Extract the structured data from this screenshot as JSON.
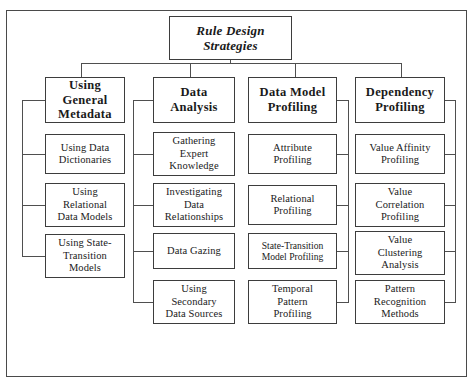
{
  "diagram": {
    "title": "Rule Design Strategies",
    "root": {
      "label": "Rule Design\nStrategies"
    },
    "branches": [
      {
        "id": "using-general-metadata",
        "header": "Using\nGeneral\nMetadata",
        "trunk_side": "left",
        "children": [
          {
            "label": "Using Data\nDictionaries"
          },
          {
            "label": "Using\nRelational\nData Models"
          },
          {
            "label": "Using State-\nTransition\nModels"
          }
        ]
      },
      {
        "id": "data-analysis",
        "header": "Data\nAnalysis",
        "trunk_side": "left",
        "children": [
          {
            "label": "Gathering\nExpert\nKnowledge"
          },
          {
            "label": "Investigating\nData\nRelationships"
          },
          {
            "label": "Data Gazing"
          },
          {
            "label": "Using\nSecondary\nData Sources"
          }
        ]
      },
      {
        "id": "data-model-profiling",
        "header": "Data Model\nProfiling",
        "trunk_side": "right",
        "children": [
          {
            "label": "Attribute\nProfiling"
          },
          {
            "label": "Relational\nProfiling"
          },
          {
            "label": "State-Transition\nModel Profiling"
          },
          {
            "label": "Temporal\nPattern\nProfiling"
          }
        ]
      },
      {
        "id": "dependency-profiling",
        "header": "Dependency\nProfiling",
        "trunk_side": "right",
        "children": [
          {
            "label": "Value Affinity\nProfiling"
          },
          {
            "label": "Value\nCorrelation\nProfiling"
          },
          {
            "label": "Value\nClustering\nAnalysis"
          },
          {
            "label": "Pattern\nRecognition\nMethods"
          }
        ]
      }
    ],
    "colors": {
      "background": "#ffffff",
      "box_border": "#3d3d3d",
      "connector": "#4f4f4f",
      "frame_border": "#4a4a4a",
      "text": "#1a1a1a"
    }
  }
}
